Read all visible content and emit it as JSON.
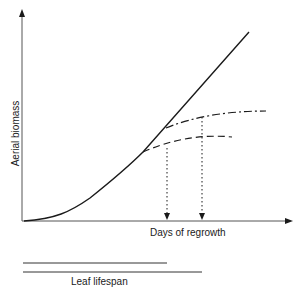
{
  "diagram": {
    "type": "line-diagram",
    "y_axis_label": "Aerial biomass",
    "x_axis_label": "Days of regrowth",
    "lifespan_label": "Leaf lifespan",
    "colors": {
      "line": "#1a1a1a",
      "axis": "#333333",
      "background": "#ffffff"
    },
    "curves": [
      {
        "name": "total-biomass",
        "style": "solid",
        "description": "sigmoid-to-linear growth"
      },
      {
        "name": "biomass-short-lifespan",
        "style": "dashed",
        "branch_from": "lower point",
        "description": "plateaus earlier"
      },
      {
        "name": "biomass-long-lifespan",
        "style": "dash-dot",
        "branch_from": "upper point",
        "description": "plateaus later"
      }
    ],
    "markers": [
      {
        "name": "short-lifespan-marker",
        "style": "dotted-arrow"
      },
      {
        "name": "long-lifespan-marker",
        "style": "dotted-arrow"
      }
    ],
    "lifespan_bars": [
      {
        "name": "short-lifespan-bar"
      },
      {
        "name": "long-lifespan-bar"
      }
    ]
  }
}
